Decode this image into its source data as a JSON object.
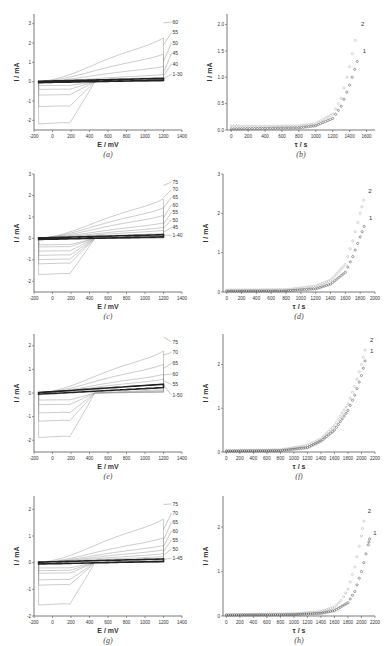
{
  "chart_data": [
    {
      "id": "a",
      "type": "line",
      "caption": "(a)",
      "xlabel": "E / mV",
      "ylabel": "I / mA",
      "xlim": [
        -200,
        1400
      ],
      "ylim": [
        -2.5,
        3.5
      ],
      "xticks": [
        -200,
        0,
        200,
        400,
        600,
        800,
        1000,
        1200,
        1400
      ],
      "yticks": [
        -2,
        -1,
        0,
        1,
        2,
        3
      ],
      "series_labels": [
        "60",
        "55",
        "50",
        "45",
        "40",
        "1-30"
      ],
      "series": [
        {
          "name": "60",
          "peak_anodic": 3.2,
          "peak_cathodic": -2.2
        },
        {
          "name": "55",
          "peak_anodic": 2.0,
          "peak_cathodic": -1.3
        },
        {
          "name": "50",
          "peak_anodic": 1.1,
          "peak_cathodic": -0.7
        },
        {
          "name": "45",
          "peak_anodic": 0.5,
          "peak_cathodic": -0.4
        },
        {
          "name": "40",
          "peak_anodic": 0.3,
          "peak_cathodic": -0.2
        },
        {
          "name": "1-30",
          "peak_anodic": 0.15,
          "peak_cathodic": -0.05
        }
      ]
    },
    {
      "id": "b",
      "type": "scatter",
      "caption": "(b)",
      "xlabel": "τ / s",
      "ylabel": "I / mA",
      "xlim": [
        -50,
        1700
      ],
      "ylim": [
        0,
        2.2
      ],
      "xticks": [
        0,
        200,
        400,
        600,
        800,
        1000,
        1200,
        1400,
        1600
      ],
      "yticks": [
        0.0,
        0.5,
        1.0,
        1.5,
        2.0
      ],
      "series": [
        {
          "name": "2",
          "x": [
            0,
            400,
            800,
            1000,
            1200,
            1300,
            1400,
            1500
          ],
          "y": [
            0.07,
            0.07,
            0.08,
            0.12,
            0.3,
            0.6,
            1.2,
            1.95
          ]
        },
        {
          "name": "1",
          "x": [
            0,
            400,
            800,
            1000,
            1200,
            1300,
            1400,
            1520
          ],
          "y": [
            0.02,
            0.03,
            0.04,
            0.08,
            0.22,
            0.45,
            0.85,
            1.45
          ]
        }
      ]
    },
    {
      "id": "c",
      "type": "line",
      "caption": "(c)",
      "xlabel": "E / mV",
      "ylabel": "I / mA",
      "xlim": [
        -200,
        1400
      ],
      "ylim": [
        -2.5,
        3
      ],
      "xticks": [
        -200,
        0,
        200,
        400,
        600,
        800,
        1000,
        1200,
        1400
      ],
      "yticks": [
        -2,
        -1,
        0,
        1,
        2,
        3
      ],
      "series_labels": [
        "75",
        "70",
        "65",
        "60",
        "55",
        "50",
        "45",
        "1-40"
      ],
      "series": [
        {
          "name": "75",
          "peak_anodic": 2.6,
          "peak_cathodic": -1.7
        },
        {
          "name": "70",
          "peak_anodic": 2.0,
          "peak_cathodic": -1.2
        },
        {
          "name": "65",
          "peak_anodic": 1.5,
          "peak_cathodic": -1.0
        },
        {
          "name": "60",
          "peak_anodic": 1.0,
          "peak_cathodic": -0.8
        },
        {
          "name": "55",
          "peak_anodic": 0.7,
          "peak_cathodic": -0.6
        },
        {
          "name": "50",
          "peak_anodic": 0.5,
          "peak_cathodic": -0.4
        },
        {
          "name": "45",
          "peak_anodic": 0.3,
          "peak_cathodic": -0.3
        },
        {
          "name": "1-40",
          "peak_anodic": 0.15,
          "peak_cathodic": -0.05
        }
      ]
    },
    {
      "id": "d",
      "type": "scatter",
      "caption": "(d)",
      "xlabel": "τ / s",
      "ylabel": "I / mA",
      "xlim": [
        -50,
        2000
      ],
      "ylim": [
        0,
        3
      ],
      "xticks": [
        0,
        200,
        400,
        600,
        800,
        1000,
        1200,
        1400,
        1600,
        1800,
        2000
      ],
      "yticks": [
        0,
        1,
        2,
        3
      ],
      "series": [
        {
          "name": "2",
          "x": [
            0,
            800,
            1200,
            1400,
            1600,
            1700,
            1800,
            1870
          ],
          "y": [
            0.05,
            0.06,
            0.15,
            0.3,
            0.7,
            1.3,
            2.0,
            2.5
          ]
        },
        {
          "name": "1",
          "x": [
            0,
            800,
            1200,
            1400,
            1600,
            1700,
            1800,
            1880
          ],
          "y": [
            0.02,
            0.03,
            0.08,
            0.2,
            0.5,
            0.9,
            1.4,
            1.8
          ]
        }
      ]
    },
    {
      "id": "e",
      "type": "line",
      "caption": "(e)",
      "xlabel": "E / mV",
      "ylabel": "I / mA",
      "xlim": [
        -200,
        1400
      ],
      "ylim": [
        -2.5,
        2.5
      ],
      "xticks": [
        -200,
        0,
        200,
        400,
        600,
        800,
        1000,
        1200,
        1400
      ],
      "yticks": [
        -2,
        -1,
        0,
        1,
        2
      ],
      "series_labels": [
        "75",
        "70",
        "65",
        "60",
        "55",
        "1-50"
      ],
      "series": [
        {
          "name": "75",
          "peak_anodic": 2.5,
          "peak_cathodic": -1.9
        },
        {
          "name": "70",
          "peak_anodic": 1.7,
          "peak_cathodic": -1.2
        },
        {
          "name": "65",
          "peak_anodic": 1.1,
          "peak_cathodic": -0.85
        },
        {
          "name": "60",
          "peak_anodic": 0.8,
          "peak_cathodic": -0.5
        },
        {
          "name": "55",
          "peak_anodic": 0.55,
          "peak_cathodic": -0.3
        },
        {
          "name": "1-50",
          "peak_anodic": 0.35,
          "peak_cathodic": -0.1
        }
      ]
    },
    {
      "id": "f",
      "type": "scatter",
      "caption": "(f)",
      "xlabel": "τ / s",
      "ylabel": "I / mA",
      "xlim": [
        -50,
        2200
      ],
      "ylim": [
        0,
        2.7
      ],
      "xticks": [
        0,
        200,
        400,
        600,
        800,
        1000,
        1200,
        1400,
        1600,
        1800,
        2000,
        2200
      ],
      "yticks": [
        0,
        1,
        2
      ],
      "series": [
        {
          "name": "2",
          "x": [
            0,
            800,
            1200,
            1400,
            1600,
            1800,
            1900,
            2000,
            2080
          ],
          "y": [
            0.03,
            0.05,
            0.15,
            0.3,
            0.6,
            1.1,
            1.5,
            2.0,
            2.5
          ]
        },
        {
          "name": "1",
          "x": [
            0,
            800,
            1200,
            1400,
            1600,
            1800,
            1900,
            2000,
            2080
          ],
          "y": [
            0.02,
            0.03,
            0.1,
            0.25,
            0.5,
            0.95,
            1.3,
            1.75,
            2.25
          ]
        }
      ]
    },
    {
      "id": "g",
      "type": "line",
      "caption": "(g)",
      "xlabel": "E / mV",
      "ylabel": "I / mA",
      "xlim": [
        -200,
        1400
      ],
      "ylim": [
        -2,
        2.5
      ],
      "xticks": [
        -200,
        0,
        200,
        400,
        600,
        800,
        1000,
        1200,
        1400
      ],
      "yticks": [
        -2,
        -1,
        0,
        1,
        2
      ],
      "series_labels": [
        "75",
        "70",
        "65",
        "60",
        "55",
        "50",
        "1-45"
      ],
      "series": [
        {
          "name": "75",
          "peak_anodic": 2.3,
          "peak_cathodic": -1.6
        },
        {
          "name": "70",
          "peak_anodic": 1.3,
          "peak_cathodic": -0.85
        },
        {
          "name": "65",
          "peak_anodic": 0.9,
          "peak_cathodic": -0.65
        },
        {
          "name": "60",
          "peak_anodic": 0.65,
          "peak_cathodic": -0.4
        },
        {
          "name": "55",
          "peak_anodic": 0.45,
          "peak_cathodic": -0.3
        },
        {
          "name": "50",
          "peak_anodic": 0.3,
          "peak_cathodic": -0.2
        },
        {
          "name": "1-45",
          "peak_anodic": 0.12,
          "peak_cathodic": -0.05
        }
      ]
    },
    {
      "id": "h",
      "type": "scatter",
      "caption": "(h)",
      "xlabel": "τ / s",
      "ylabel": "I / mA",
      "xlim": [
        -50,
        2200
      ],
      "ylim": [
        0,
        2.7
      ],
      "xticks": [
        0,
        200,
        400,
        600,
        800,
        1000,
        1200,
        1400,
        1600,
        1800,
        2000,
        2200
      ],
      "yticks": [
        0,
        1,
        2
      ],
      "series": [
        {
          "name": "2",
          "x": [
            0,
            1000,
            1400,
            1600,
            1700,
            1800,
            1900,
            2000,
            2050
          ],
          "y": [
            0.03,
            0.05,
            0.1,
            0.2,
            0.35,
            0.6,
            1.1,
            1.8,
            2.3
          ]
        },
        {
          "name": "1",
          "x": [
            0,
            1000,
            1400,
            1600,
            1800,
            1900,
            2000,
            2100,
            2130
          ],
          "y": [
            0.02,
            0.03,
            0.06,
            0.12,
            0.3,
            0.55,
            1.0,
            1.6,
            1.8
          ]
        }
      ]
    }
  ],
  "captions": {
    "a": "(a)",
    "b": "(b)",
    "c": "(c)",
    "d": "(d)",
    "e": "(e)",
    "f": "(f)",
    "g": "(g)",
    "h": "(h)"
  },
  "axis_labels": {
    "cv_x": "E / mV",
    "ct_x": "τ / s",
    "y": "I / mA"
  }
}
